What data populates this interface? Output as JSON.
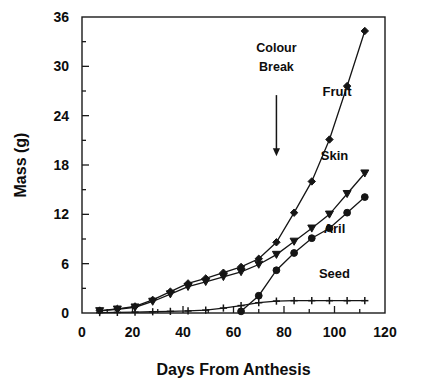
{
  "chart_data": {
    "type": "line",
    "title": "",
    "xlabel": "Days From Anthesis",
    "ylabel": "Mass (g)",
    "xlim": [
      0,
      120
    ],
    "ylim": [
      0,
      36
    ],
    "xticks": [
      0,
      20,
      40,
      60,
      80,
      100,
      120
    ],
    "yticks": [
      0,
      6,
      12,
      18,
      24,
      30,
      36
    ],
    "grid": false,
    "legend_position": "inline-right-of-curves",
    "annotations": [
      {
        "text_lines": [
          "Colour",
          "Break"
        ],
        "x": 77,
        "arrow_from_y": 26.5,
        "arrow_to_y": 19.2
      }
    ],
    "series": [
      {
        "name": "Fruit",
        "marker": "diamond",
        "label_x": 101,
        "label_y": 26.4,
        "x": [
          7,
          14,
          21,
          28,
          35,
          42,
          49,
          56,
          63,
          70,
          77,
          84,
          91,
          98,
          105,
          112
        ],
        "values": [
          0.3,
          0.5,
          0.8,
          1.6,
          2.6,
          3.6,
          4.2,
          4.9,
          5.6,
          6.6,
          8.6,
          12.2,
          16.0,
          21.1,
          27.6,
          34.3
        ]
      },
      {
        "name": "Skin",
        "marker": "triangle-down",
        "label_x": 100,
        "label_y": 18.6,
        "x": [
          7,
          14,
          21,
          28,
          35,
          42,
          49,
          56,
          63,
          70,
          77,
          84,
          91,
          98,
          105,
          112
        ],
        "values": [
          0.25,
          0.45,
          0.7,
          1.4,
          2.3,
          3.2,
          3.8,
          4.4,
          5.0,
          5.9,
          7.1,
          8.7,
          10.3,
          12.0,
          14.5,
          17.0
        ]
      },
      {
        "name": "Aril",
        "marker": "circle",
        "label_x": 100,
        "label_y": 9.7,
        "x": [
          63,
          70,
          77,
          84,
          91,
          98,
          105,
          112
        ],
        "values": [
          0.2,
          2.1,
          5.2,
          7.3,
          9.1,
          10.3,
          12.2,
          14.1
        ]
      },
      {
        "name": "Seed",
        "marker": "plus",
        "label_x": 100,
        "label_y": 4.3,
        "x": [
          7,
          14,
          21,
          28,
          35,
          42,
          49,
          56,
          63,
          70,
          77,
          84,
          91,
          98,
          105,
          112
        ],
        "values": [
          0.05,
          0.07,
          0.1,
          0.15,
          0.2,
          0.25,
          0.35,
          0.6,
          0.9,
          1.25,
          1.45,
          1.5,
          1.5,
          1.5,
          1.5,
          1.5
        ]
      }
    ]
  }
}
